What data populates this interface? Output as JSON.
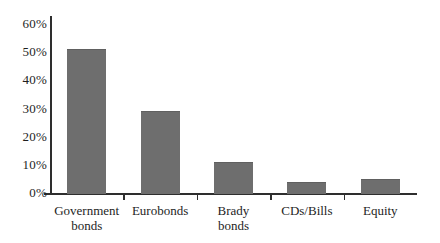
{
  "figure": {
    "title": "",
    "background_color": "#ffffff"
  },
  "chart_data": {
    "type": "bar",
    "title": "",
    "xlabel": "",
    "ylabel": "",
    "unit": "percent",
    "categories": [
      "Government bonds",
      "Eurobonds",
      "Brady bonds",
      "CDs/Bills",
      "Equity"
    ],
    "category_label_lines": [
      [
        "Government",
        "bonds"
      ],
      [
        "Eurobonds"
      ],
      [
        "Brady",
        "bonds"
      ],
      [
        "CDs/Bills"
      ],
      [
        "Equity"
      ]
    ],
    "values": [
      51,
      29,
      11,
      4,
      5
    ],
    "ylim": [
      0,
      60
    ],
    "ytick_interval": 10,
    "ytick_labels": [
      "0%",
      "10%",
      "20%",
      "30%",
      "40%",
      "50%",
      "60%"
    ],
    "grid": false,
    "legend": null,
    "data_labels": false,
    "bar_color": "#6e6e6e",
    "axis_color": "#2e2e2e",
    "label_color": "#1e1e1e",
    "background_color": "#ffffff"
  }
}
